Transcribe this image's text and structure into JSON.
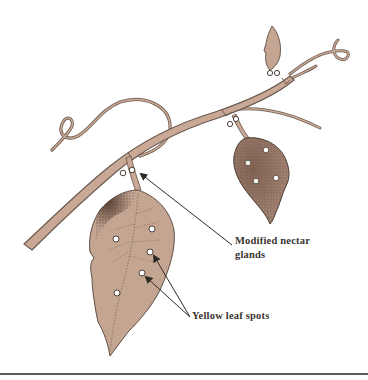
{
  "figure": {
    "colors": {
      "leaf_fill": "#c4a591",
      "stem_fill": "#c9a995",
      "outline": "#6b5a50",
      "shading": "#4a3328",
      "gland_fill": "#ffffff",
      "arrow": "#2f2a27",
      "rule": "#5a5a5a"
    }
  },
  "labels": {
    "nectar_glands_line1": "Modified nectar",
    "nectar_glands_line2": "glands",
    "leaf_spots": "Yellow leaf spots"
  }
}
